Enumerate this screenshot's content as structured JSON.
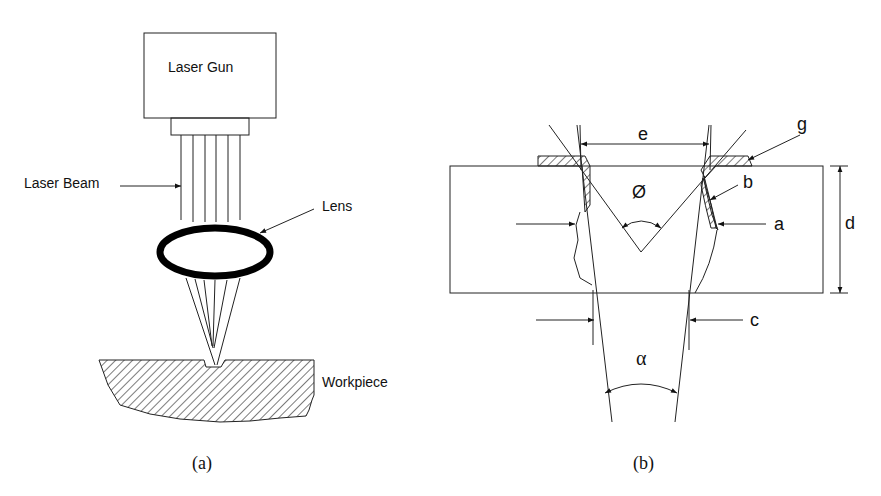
{
  "panel_a": {
    "caption": "(a)",
    "laser_gun_label": "Laser Gun",
    "laser_beam_label": "Laser Beam",
    "lens_label": "Lens",
    "workpiece_label": "Workpiece"
  },
  "panel_b": {
    "caption": "(b)",
    "labels": {
      "e": "e",
      "g": "g",
      "b": "b",
      "a": "a",
      "d": "d",
      "c": "c",
      "phi": "Ø",
      "alpha": "α"
    }
  }
}
